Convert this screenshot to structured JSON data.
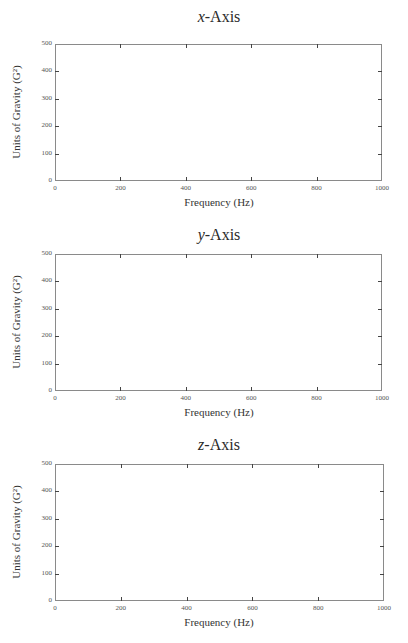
{
  "chart_data": [
    {
      "type": "line",
      "title": "x-Axis",
      "title_var": "x",
      "title_rest": "-Axis",
      "xlabel": "Frequency (Hz)",
      "ylabel": "Units of Gravity (G²)",
      "xlim": [
        0,
        1000
      ],
      "ylim": [
        0,
        500
      ],
      "xticks": [
        0,
        200,
        400,
        600,
        800,
        1000
      ],
      "yticks": [
        0,
        100,
        200,
        300,
        400,
        500
      ],
      "grid": false,
      "series": []
    },
    {
      "type": "line",
      "title": "y-Axis",
      "title_var": "y",
      "title_rest": "-Axis",
      "xlabel": "Frequency (Hz)",
      "ylabel": "Units of Gravity (G²)",
      "xlim": [
        0,
        1000
      ],
      "ylim": [
        0,
        500
      ],
      "xticks": [
        0,
        200,
        400,
        600,
        800,
        1000
      ],
      "yticks": [
        0,
        100,
        200,
        300,
        400,
        500
      ],
      "grid": false,
      "series": []
    },
    {
      "type": "line",
      "title": "z-Axis",
      "title_var": "z",
      "title_rest": "-Axis",
      "xlabel": "Frequency (Hz)",
      "ylabel": "Units of Gravity (G²)",
      "xlim": [
        0,
        1000
      ],
      "ylim": [
        0,
        500
      ],
      "xticks": [
        0,
        200,
        400,
        600,
        800,
        1000
      ],
      "yticks": [
        0,
        100,
        200,
        300,
        400,
        500
      ],
      "grid": false,
      "series": []
    }
  ],
  "layout": {
    "panels": [
      {
        "title_top": 8,
        "frame": {
          "left": 55,
          "top": 44,
          "right": 382,
          "bottom": 181
        }
      },
      {
        "title_top": 226,
        "frame": {
          "left": 55,
          "top": 254,
          "right": 382,
          "bottom": 391
        }
      },
      {
        "title_top": 436,
        "frame": {
          "left": 55,
          "top": 464,
          "right": 384,
          "bottom": 601
        }
      }
    ]
  }
}
